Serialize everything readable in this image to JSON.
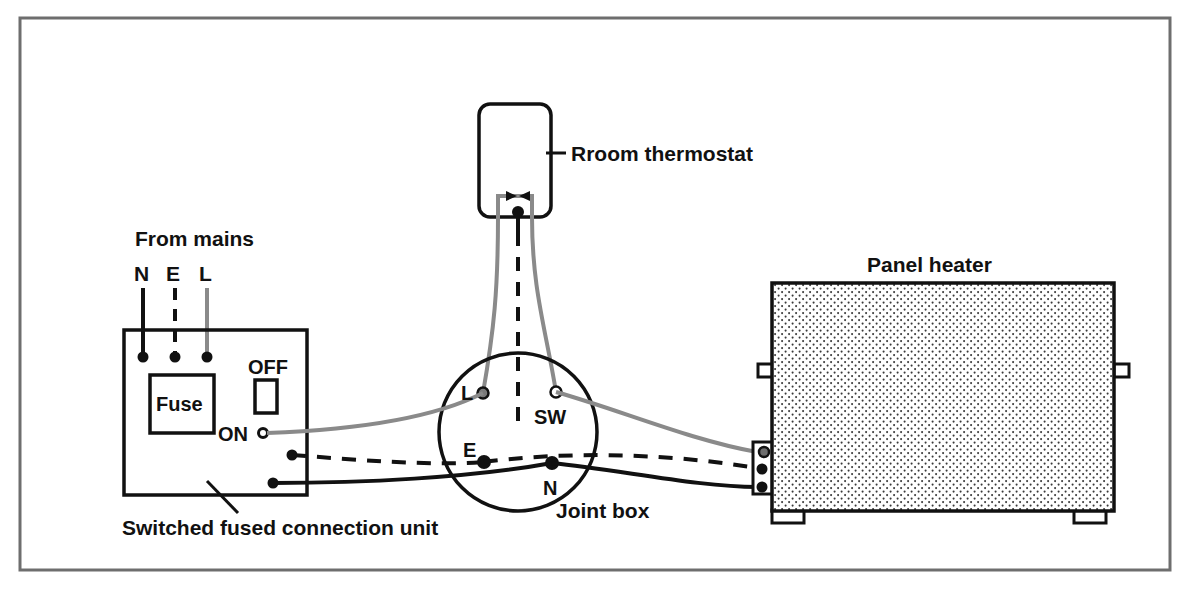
{
  "diagram": {
    "title_visible": false,
    "frame": {
      "present": true,
      "color": "#6e6e6e"
    },
    "colors": {
      "ink": "#111111",
      "live_wire": "#8a8a8a",
      "neutral_wire": "#111111",
      "earth_wire": "#111111",
      "heater_fill": "#f2f2f2",
      "frame": "#6e6e6e",
      "paper": "#ffffff"
    },
    "labels": {
      "from_mains": "From mains",
      "mains_n": "N",
      "mains_e": "E",
      "mains_l": "L",
      "fuse": "Fuse",
      "switch_off": "OFF",
      "switch_on": "ON",
      "connection_unit": "Switched fused connection unit",
      "thermostat": "Rroom thermostat",
      "joint_box": "Joint box",
      "terminal_l": "L",
      "terminal_sw": "SW",
      "terminal_e": "E",
      "terminal_n": "N",
      "panel_heater": "Panel heater"
    },
    "components": [
      {
        "name": "switched-fused-connection-unit",
        "label": "Switched fused connection unit"
      },
      {
        "name": "room-thermostat",
        "label": "Rroom thermostat"
      },
      {
        "name": "joint-box",
        "label": "Joint box"
      },
      {
        "name": "panel-heater",
        "label": "Panel heater"
      }
    ],
    "joint_box_terminals": [
      "L",
      "SW",
      "E",
      "N"
    ],
    "mains_conductors": [
      "N",
      "E",
      "L"
    ]
  }
}
